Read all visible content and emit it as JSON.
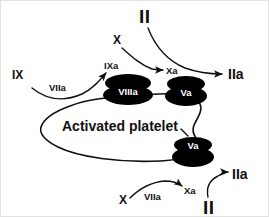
{
  "diagram": {
    "background_color": "#ffffff",
    "ink_color": "#111111",
    "complex_fill": "#000000",
    "complex_text_color": "#ffffff"
  },
  "labels": {
    "factor_ix": "IX",
    "viia_upper": "VIIa",
    "factor_ixa": "IXa",
    "factor_x_upper": "X",
    "factor_xa_upper": "Xa",
    "factor_ii_upper": "II",
    "factor_iia_upper": "IIa",
    "complex_viiia": "VIIIa",
    "complex_va_upper": "Va",
    "complex_va_lower": "Va",
    "platelet": "Activated platelet",
    "factor_x_lower": "X",
    "viia_lower": "VIIa",
    "factor_xa_lower": "Xa",
    "factor_ii_lower": "II",
    "factor_iia_lower": "IIa"
  },
  "nodes": [
    {
      "name": "factor-ix",
      "text": "IX",
      "x": 12,
      "y": 79,
      "style": "lbl-md"
    },
    {
      "name": "viia-upper",
      "text": "VIIa",
      "x": 49,
      "y": 91,
      "style": "lbl-sm"
    },
    {
      "name": "factor-ixa",
      "text": "IXa",
      "x": 105,
      "y": 69,
      "style": "lbl-sm"
    },
    {
      "name": "factor-x-upper",
      "text": "X",
      "x": 113,
      "y": 44,
      "style": "lbl-md"
    },
    {
      "name": "factor-xa-upper",
      "text": "Xa",
      "x": 166,
      "y": 73,
      "style": "lbl-sm"
    },
    {
      "name": "factor-ii-upper",
      "text": "II",
      "x": 139,
      "y": 22,
      "style": "lbl-xl"
    },
    {
      "name": "factor-iia-upper",
      "text": "IIa",
      "x": 230,
      "y": 78,
      "style": "lbl-lg"
    },
    {
      "name": "factor-x-lower",
      "text": "X",
      "x": 120,
      "y": 203,
      "style": "lbl-md"
    },
    {
      "name": "viia-lower",
      "text": "VIIa",
      "x": 146,
      "y": 199,
      "style": "lbl-sm"
    },
    {
      "name": "factor-xa-lower",
      "text": "Xa",
      "x": 185,
      "y": 194,
      "style": "lbl-sm"
    },
    {
      "name": "factor-ii-lower",
      "text": "II",
      "x": 205,
      "y": 213,
      "style": "lbl-xl"
    },
    {
      "name": "factor-iia-lower",
      "text": "IIa",
      "x": 234,
      "y": 178,
      "style": "lbl-lg"
    }
  ],
  "complexes": [
    {
      "name": "complex-viiia",
      "label": "VIIIa",
      "cx": 128,
      "cy": 91
    },
    {
      "name": "complex-va-upper",
      "label": "Va",
      "cx": 186,
      "cy": 91
    },
    {
      "name": "complex-va-lower",
      "label": "Va",
      "cx": 193,
      "cy": 148
    }
  ],
  "platelet": {
    "name": "activated-platelet",
    "label": "Activated platelet",
    "label_x": 62,
    "label_y": 131
  },
  "arrows": [
    {
      "name": "arrow-ix-to-ixa",
      "from": "IX",
      "to": "IXa",
      "cofactor": "VIIa"
    },
    {
      "name": "arrow-x-to-xa-upper",
      "from": "X",
      "to": "Xa"
    },
    {
      "name": "arrow-ii-to-iia-upper",
      "from": "II",
      "to": "IIa"
    },
    {
      "name": "arrow-x-to-xa-lower",
      "from": "X",
      "to": "Xa",
      "cofactor": "VIIa"
    },
    {
      "name": "arrow-ii-to-iia-lower",
      "from": "II",
      "to": "IIa"
    }
  ]
}
